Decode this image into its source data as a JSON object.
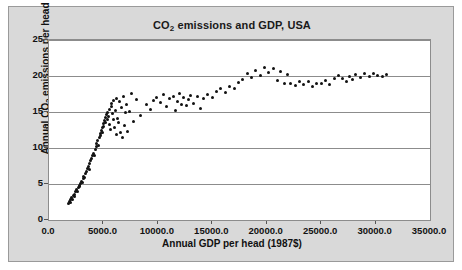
{
  "chart_data": {
    "type": "scatter",
    "title": "CO2 emissions and GDP, USA",
    "title_parts": {
      "pre": "CO",
      "sub": "2",
      "post": " emissions and GDP, USA"
    },
    "xlabel": "Annual GDP per head (1987$)",
    "ylabel": "Annual CO2 emissions per head (tonnes)",
    "ylabel_parts": {
      "pre": "Annual CO",
      "sub": "2",
      "post": " emissions per head (tonnes)"
    },
    "xlim": [
      0,
      35000
    ],
    "ylim": [
      0,
      25
    ],
    "grid": true,
    "legend": null,
    "xticks": [
      0,
      5000,
      10000,
      15000,
      20000,
      25000,
      30000,
      35000
    ],
    "xtick_labels": [
      "0.0",
      "5000.0",
      "10000.0",
      "15000.0",
      "20000.0",
      "25000.0",
      "30000.0",
      "35000.0"
    ],
    "yticks": [
      0,
      5,
      10,
      15,
      20,
      25
    ],
    "ytick_labels": [
      "0",
      "5",
      "10",
      "15",
      "20",
      "25"
    ],
    "marker_color": "#111111",
    "plot_bg": "#ffffff",
    "frame_bg": "#d9d9d9",
    "points": [
      [
        1820,
        2.3
      ],
      [
        1900,
        2.6
      ],
      [
        1960,
        2.4
      ],
      [
        2010,
        2.9
      ],
      [
        2080,
        3.1
      ],
      [
        2150,
        2.8
      ],
      [
        2220,
        3.4
      ],
      [
        2300,
        3.6
      ],
      [
        2380,
        3.3
      ],
      [
        2450,
        3.9
      ],
      [
        2520,
        4.2
      ],
      [
        2600,
        4.0
      ],
      [
        2680,
        4.5
      ],
      [
        2760,
        4.8
      ],
      [
        2830,
        4.6
      ],
      [
        2900,
        5.1
      ],
      [
        2980,
        5.4
      ],
      [
        3050,
        5.2
      ],
      [
        3130,
        5.8
      ],
      [
        3200,
        6.1
      ],
      [
        3280,
        5.9
      ],
      [
        3360,
        6.5
      ],
      [
        3440,
        6.8
      ],
      [
        3520,
        7.1
      ],
      [
        3600,
        7.4
      ],
      [
        3680,
        7.0
      ],
      [
        3760,
        7.8
      ],
      [
        3840,
        8.2
      ],
      [
        3920,
        8.5
      ],
      [
        4000,
        8.9
      ],
      [
        4080,
        9.3
      ],
      [
        4160,
        9.0
      ],
      [
        4240,
        9.8
      ],
      [
        4320,
        10.2
      ],
      [
        4400,
        10.6
      ],
      [
        4480,
        11.0
      ],
      [
        4560,
        10.4
      ],
      [
        4640,
        11.5
      ],
      [
        4700,
        12.0
      ],
      [
        4760,
        11.8
      ],
      [
        4820,
        12.4
      ],
      [
        4880,
        12.9
      ],
      [
        4940,
        12.2
      ],
      [
        5000,
        13.4
      ],
      [
        5050,
        13.0
      ],
      [
        5100,
        13.8
      ],
      [
        5160,
        14.2
      ],
      [
        5220,
        13.6
      ],
      [
        5280,
        14.6
      ],
      [
        5340,
        14.0
      ],
      [
        5400,
        15.0
      ],
      [
        5460,
        14.4
      ],
      [
        5520,
        15.4
      ],
      [
        5580,
        13.2
      ],
      [
        5640,
        12.6
      ],
      [
        5700,
        15.8
      ],
      [
        5760,
        16.2
      ],
      [
        5820,
        14.8
      ],
      [
        5880,
        13.9
      ],
      [
        5940,
        16.6
      ],
      [
        6000,
        12.8
      ],
      [
        6080,
        15.2
      ],
      [
        6160,
        11.9
      ],
      [
        6240,
        16.9
      ],
      [
        6320,
        14.1
      ],
      [
        6400,
        13.5
      ],
      [
        6480,
        16.4
      ],
      [
        6560,
        12.1
      ],
      [
        6640,
        15.6
      ],
      [
        6720,
        11.4
      ],
      [
        6800,
        17.2
      ],
      [
        6900,
        13.1
      ],
      [
        7000,
        14.9
      ],
      [
        7100,
        16.1
      ],
      [
        7250,
        12.3
      ],
      [
        7400,
        15.1
      ],
      [
        7600,
        17.6
      ],
      [
        7800,
        13.7
      ],
      [
        8000,
        16.8
      ],
      [
        8400,
        14.5
      ],
      [
        9000,
        16.0
      ],
      [
        9300,
        15.4
      ],
      [
        9600,
        16.6
      ],
      [
        9900,
        17.0
      ],
      [
        10200,
        16.3
      ],
      [
        10500,
        17.4
      ],
      [
        10800,
        15.8
      ],
      [
        11100,
        16.9
      ],
      [
        11400,
        17.2
      ],
      [
        11600,
        15.2
      ],
      [
        11800,
        16.5
      ],
      [
        12000,
        17.6
      ],
      [
        12200,
        16.1
      ],
      [
        12400,
        17.0
      ],
      [
        12600,
        15.9
      ],
      [
        12800,
        16.7
      ],
      [
        13000,
        17.3
      ],
      [
        13300,
        16.2
      ],
      [
        13600,
        17.1
      ],
      [
        13900,
        15.5
      ],
      [
        14200,
        16.9
      ],
      [
        14600,
        17.5
      ],
      [
        15000,
        17.0
      ],
      [
        15400,
        17.9
      ],
      [
        15800,
        18.3
      ],
      [
        16200,
        17.7
      ],
      [
        16600,
        18.6
      ],
      [
        17000,
        18.2
      ],
      [
        17400,
        19.1
      ],
      [
        17800,
        19.5
      ],
      [
        18200,
        20.3
      ],
      [
        18600,
        19.8
      ],
      [
        19000,
        20.8
      ],
      [
        19400,
        20.1
      ],
      [
        19800,
        21.2
      ],
      [
        20200,
        20.5
      ],
      [
        20600,
        21.0
      ],
      [
        21000,
        19.4
      ],
      [
        21300,
        20.6
      ],
      [
        21600,
        18.9
      ],
      [
        21900,
        20.2
      ],
      [
        22200,
        19.0
      ],
      [
        22600,
        18.7
      ],
      [
        23000,
        19.3
      ],
      [
        23400,
        18.8
      ],
      [
        23800,
        19.2
      ],
      [
        24200,
        18.6
      ],
      [
        24600,
        19.0
      ],
      [
        25000,
        18.9
      ],
      [
        25400,
        19.4
      ],
      [
        25800,
        18.8
      ],
      [
        26200,
        19.6
      ],
      [
        26600,
        20.1
      ],
      [
        27000,
        19.7
      ],
      [
        27300,
        19.2
      ],
      [
        27600,
        19.9
      ],
      [
        27900,
        19.5
      ],
      [
        28200,
        20.2
      ],
      [
        28600,
        19.8
      ],
      [
        29000,
        20.4
      ],
      [
        29400,
        20.0
      ],
      [
        29800,
        20.3
      ],
      [
        30200,
        20.1
      ],
      [
        30600,
        19.9
      ],
      [
        31000,
        20.2
      ]
    ]
  }
}
